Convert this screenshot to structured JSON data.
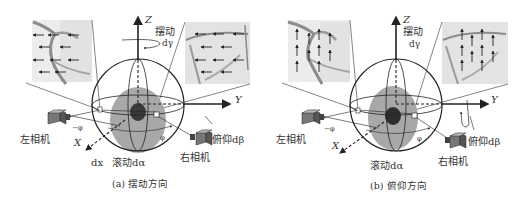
{
  "panels": [
    {
      "id": "a",
      "caption": "(a) 摆动方向",
      "axis_z": "Z",
      "axis_y": "Y",
      "axis_x": "X",
      "yaw_label": "摆动",
      "yaw_delta": "dγ",
      "roll_label": "滚动dα",
      "pitch_label": "俯仰dβ",
      "dx_label": "dx",
      "left_camera": "左相机",
      "right_camera": "右相机",
      "neg_phi": "−φ",
      "phi": "φ",
      "flow_direction": "left"
    },
    {
      "id": "b",
      "caption": "(b) 俯仰方向",
      "axis_z": "Z",
      "axis_y": "Y",
      "axis_x": "X",
      "yaw_label": "摆动",
      "yaw_delta": "dγ",
      "roll_label": "滚动dα",
      "pitch_label": "俯仰dβ",
      "left_camera": "左相机",
      "right_camera": "右相机",
      "neg_phi": "−φ",
      "phi": "φ",
      "flow_direction": "up"
    }
  ],
  "colors": {
    "line": "#222222",
    "sphere_shade": "#9a9a9a",
    "core": "#3a3a3a",
    "image_bg": "#e6e6e6",
    "vessel": "#8c8c8c"
  }
}
